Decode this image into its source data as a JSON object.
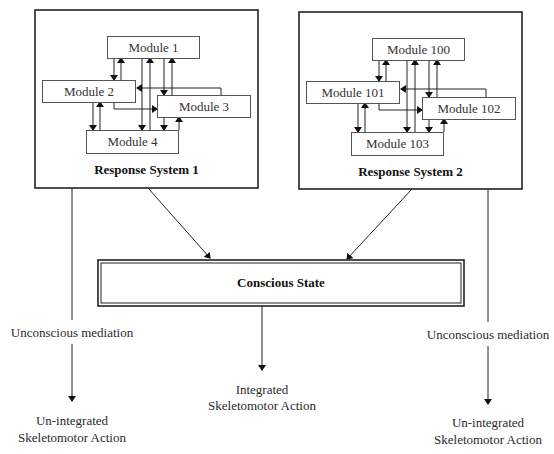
{
  "systems": [
    {
      "title": "Response System 1",
      "modules": [
        "Module 1",
        "Module 2",
        "Module 3",
        "Module 4"
      ]
    },
    {
      "title": "Response System 2",
      "modules": [
        "Module 100",
        "Module 101",
        "Module 102",
        "Module 103"
      ]
    }
  ],
  "conscious_state": "Conscious State",
  "left_path": {
    "mediation": "Unconscious mediation",
    "action_line1": "Un-integrated",
    "action_line2": "Skeletomotor Action"
  },
  "center_path": {
    "action_line1": "Integrated",
    "action_line2": "Skeletomotor Action"
  },
  "right_path": {
    "mediation": "Unconscious mediation",
    "action_line1": "Un-integrated",
    "action_line2": "Skeletomotor Action"
  }
}
